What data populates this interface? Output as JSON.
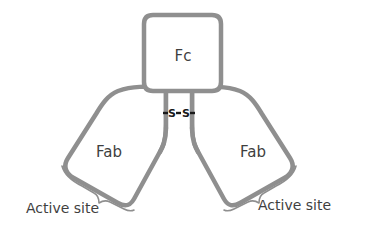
{
  "diagram": {
    "type": "antibody-structure",
    "regions": {
      "fc": {
        "label": "Fc"
      },
      "fab_left": {
        "label": "Fab"
      },
      "fab_right": {
        "label": "Fab"
      }
    },
    "disulfide_bond": {
      "label": "S-S",
      "left_atom": "S",
      "right_atom": "S"
    },
    "annotations": {
      "active_site_left": "Active site",
      "active_site_right": "Active site"
    },
    "colors": {
      "outline": "#8f8f8f",
      "text": "#3f3f3f",
      "bond": "#1a1a1a",
      "background": "#ffffff"
    }
  }
}
